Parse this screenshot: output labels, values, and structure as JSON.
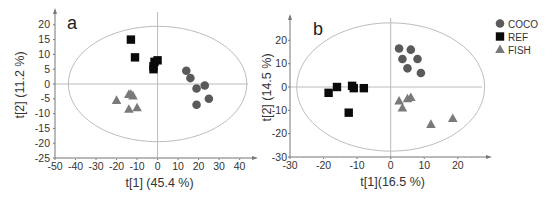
{
  "figure": {
    "legend": {
      "entries": [
        {
          "label": "COCO",
          "marker": "circle",
          "color": "#5a5a5a"
        },
        {
          "label": "REF",
          "marker": "square",
          "color": "#0a0a0a"
        },
        {
          "label": "FISH",
          "marker": "triangle",
          "color": "#7a7a7a"
        }
      ]
    }
  },
  "chart_data": [
    {
      "type": "scatter",
      "panel_label": "a",
      "title": "",
      "xlabel": "t[1] (45.4 %)",
      "ylabel": "t[2] (11.2 %)",
      "xlim": [
        -50,
        47
      ],
      "ylim": [
        -25,
        24
      ],
      "xticks": [
        -50,
        -40,
        -30,
        -20,
        -10,
        0,
        10,
        20,
        30,
        40
      ],
      "yticks": [
        20,
        15,
        10,
        5,
        0,
        -5,
        -10,
        -15,
        -20,
        -25
      ],
      "grid": false,
      "ellipse": {
        "cx": 0,
        "cy": 0,
        "rx": 43.5,
        "ry": 19.5
      },
      "series": [
        {
          "name": "REF",
          "marker": "square",
          "points": [
            [
              -13,
              15
            ],
            [
              -11,
              9
            ],
            [
              -2,
              6
            ],
            [
              -1.5,
              7.5
            ],
            [
              0,
              8
            ],
            [
              -2,
              5
            ]
          ]
        },
        {
          "name": "COCO",
          "marker": "circle",
          "points": [
            [
              14,
              4.5
            ],
            [
              16,
              2
            ],
            [
              19,
              -1.5
            ],
            [
              23,
              -0.5
            ],
            [
              25,
              -5
            ],
            [
              19,
              -7
            ]
          ]
        },
        {
          "name": "FISH",
          "marker": "triangle",
          "points": [
            [
              -20,
              -5.5
            ],
            [
              -14,
              -3.5
            ],
            [
              -13,
              -3.5
            ],
            [
              -12,
              -4
            ],
            [
              -14,
              -8.5
            ],
            [
              -10,
              -8
            ]
          ]
        }
      ]
    },
    {
      "type": "scatter",
      "panel_label": "b",
      "title": "",
      "xlabel": "t[1](16.5 %)",
      "ylabel": "t[2] (14.5 %)",
      "xlim": [
        -30,
        29
      ],
      "ylim": [
        -30,
        29
      ],
      "xticks": [
        -30,
        -20,
        -10,
        0,
        10,
        20
      ],
      "yticks": [
        20,
        10,
        0,
        -10,
        -20,
        -30
      ],
      "grid": false,
      "ellipse": {
        "cx": 0,
        "cy": 0,
        "rx": 28,
        "ry": 27.5
      },
      "series": [
        {
          "name": "REF",
          "marker": "square",
          "points": [
            [
              -18.5,
              -2.5
            ],
            [
              -16,
              0
            ],
            [
              -11.5,
              0.5
            ],
            [
              -11,
              -0.5
            ],
            [
              -8,
              -0.5
            ],
            [
              -12.5,
              -11
            ]
          ]
        },
        {
          "name": "COCO",
          "marker": "circle",
          "points": [
            [
              2.5,
              16.5
            ],
            [
              6,
              16
            ],
            [
              3.5,
              12
            ],
            [
              8,
              12
            ],
            [
              5,
              8
            ],
            [
              9,
              6
            ]
          ]
        },
        {
          "name": "FISH",
          "marker": "triangle",
          "points": [
            [
              2.5,
              -6
            ],
            [
              5,
              -5
            ],
            [
              6,
              -4.5
            ],
            [
              3.5,
              -9
            ],
            [
              12,
              -16
            ],
            [
              18.5,
              -13.5
            ]
          ]
        }
      ]
    }
  ]
}
